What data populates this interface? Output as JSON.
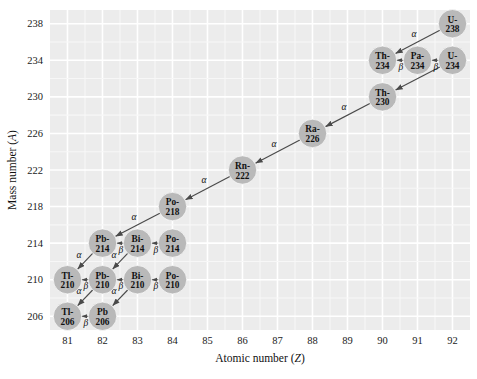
{
  "chart_data": {
    "type": "scatter",
    "title": "",
    "xlabel": "Atomic number (Z)",
    "ylabel": "Mass number (A)",
    "xlim": [
      80.5,
      92.5
    ],
    "ylim": [
      204.5,
      239.5
    ],
    "xticks": [
      81,
      82,
      83,
      84,
      85,
      86,
      87,
      88,
      89,
      90,
      91,
      92
    ],
    "yticks": [
      206,
      210,
      214,
      218,
      222,
      226,
      230,
      234,
      238
    ],
    "grid": true,
    "legend": "none",
    "colors": {
      "plot_background": "#ececec",
      "gridline": "#ffffff",
      "node_fill": "#b9b9b9",
      "node_text": "#111111",
      "arrow": "#4a4a4a",
      "page_background": "#ffffff"
    },
    "nodes": [
      {
        "id": "U-238",
        "element": "U",
        "line1": "U-",
        "line2": "238",
        "z": 92,
        "a": 238
      },
      {
        "id": "Th-234",
        "element": "Th",
        "line1": "Th-",
        "line2": "234",
        "z": 90,
        "a": 234
      },
      {
        "id": "Pa-234",
        "element": "Pa",
        "line1": "Pa-",
        "line2": "234",
        "z": 91,
        "a": 234
      },
      {
        "id": "U-234",
        "element": "U",
        "line1": "U-",
        "line2": "234",
        "z": 92,
        "a": 234
      },
      {
        "id": "Th-230",
        "element": "Th",
        "line1": "Th-",
        "line2": "230",
        "z": 90,
        "a": 230
      },
      {
        "id": "Ra-226",
        "element": "Ra",
        "line1": "Ra-",
        "line2": "226",
        "z": 88,
        "a": 226
      },
      {
        "id": "Rn-222",
        "element": "Rn",
        "line1": "Rn-",
        "line2": "222",
        "z": 86,
        "a": 222
      },
      {
        "id": "Po-218",
        "element": "Po",
        "line1": "Po-",
        "line2": "218",
        "z": 84,
        "a": 218
      },
      {
        "id": "Pb-214",
        "element": "Pb",
        "line1": "Pb-",
        "line2": "214",
        "z": 82,
        "a": 214
      },
      {
        "id": "Bi-214",
        "element": "Bi",
        "line1": "Bi-",
        "line2": "214",
        "z": 83,
        "a": 214
      },
      {
        "id": "Po-214",
        "element": "Po",
        "line1": "Po-",
        "line2": "214",
        "z": 84,
        "a": 214
      },
      {
        "id": "Tl-210",
        "element": "Tl",
        "line1": "Tl-",
        "line2": "210",
        "z": 81,
        "a": 210
      },
      {
        "id": "Pb-210",
        "element": "Pb",
        "line1": "Pb-",
        "line2": "210",
        "z": 82,
        "a": 210
      },
      {
        "id": "Bi-210",
        "element": "Bi",
        "line1": "Bi-",
        "line2": "210",
        "z": 83,
        "a": 210
      },
      {
        "id": "Po-210",
        "element": "Po",
        "line1": "Po-",
        "line2": "210",
        "z": 84,
        "a": 210
      },
      {
        "id": "Tl-206",
        "element": "Tl",
        "line1": "Tl-",
        "line2": "206",
        "z": 81,
        "a": 206
      },
      {
        "id": "Pb-206",
        "element": "Pb",
        "line1": "Pb ",
        "line2": "206",
        "z": 82,
        "a": 206
      }
    ],
    "edges": [
      {
        "from": "U-238",
        "to": "Th-234",
        "type": "alpha",
        "label": "α"
      },
      {
        "from": "Pa-234",
        "to": "Th-234",
        "type": "beta",
        "label": "β"
      },
      {
        "from": "U-234",
        "to": "Pa-234",
        "type": "beta",
        "label": "β"
      },
      {
        "from": "U-234",
        "to": "Th-230",
        "type": "alpha",
        "label": "α"
      },
      {
        "from": "Th-230",
        "to": "Ra-226",
        "type": "alpha",
        "label": "α"
      },
      {
        "from": "Ra-226",
        "to": "Rn-222",
        "type": "alpha",
        "label": "α"
      },
      {
        "from": "Rn-222",
        "to": "Po-218",
        "type": "alpha",
        "label": "α"
      },
      {
        "from": "Po-218",
        "to": "Pb-214",
        "type": "alpha",
        "label": "α"
      },
      {
        "from": "Bi-214",
        "to": "Pb-214",
        "type": "beta",
        "label": "β"
      },
      {
        "from": "Po-214",
        "to": "Bi-214",
        "type": "beta",
        "label": "β"
      },
      {
        "from": "Pb-214",
        "to": "Tl-210",
        "type": "alpha",
        "label": "α"
      },
      {
        "from": "Bi-214",
        "to": "Pb-210",
        "type": "alpha",
        "label": "α"
      },
      {
        "from": "Pb-210",
        "to": "Tl-210",
        "type": "beta",
        "label": "β"
      },
      {
        "from": "Bi-210",
        "to": "Pb-210",
        "type": "beta",
        "label": "β"
      },
      {
        "from": "Po-210",
        "to": "Bi-210",
        "type": "beta",
        "label": "β"
      },
      {
        "from": "Pb-210",
        "to": "Tl-206",
        "type": "alpha",
        "label": "α"
      },
      {
        "from": "Bi-210",
        "to": "Pb-206",
        "type": "alpha",
        "label": "α"
      },
      {
        "from": "Pb-206",
        "to": "Tl-206",
        "type": "beta",
        "label": "β"
      }
    ]
  }
}
